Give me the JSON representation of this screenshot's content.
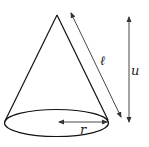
{
  "figure": {
    "type": "cone",
    "labels": {
      "slant": "ℓ",
      "height": "u",
      "radius": "r"
    },
    "colors": {
      "stroke": "#111111",
      "arrow": "#333333",
      "background": "#ffffff"
    }
  }
}
